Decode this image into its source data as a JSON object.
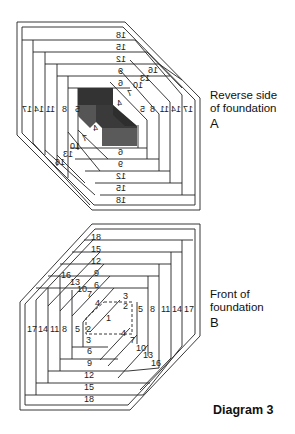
{
  "figure": {
    "title": "Diagram 3",
    "panels": [
      {
        "id": "A",
        "caption_line1": "Reverse side",
        "caption_line2": "of foundation",
        "letter": "A",
        "mirrored": true
      },
      {
        "id": "B",
        "caption_line1": "Front of",
        "caption_line2": "foundation",
        "letter": "B",
        "mirrored": false
      }
    ],
    "strip_numbers": {
      "top_stack": [
        "18",
        "15",
        "12",
        "9",
        "6",
        "3"
      ],
      "bottom_stack": [
        "18",
        "15",
        "12",
        "9",
        "6",
        "3"
      ],
      "left_column": [
        "17",
        "14",
        "11",
        "8",
        "5"
      ],
      "right_column": [
        "5",
        "8",
        "11",
        "14",
        "17"
      ],
      "upper_diagonal": [
        "16",
        "13",
        "10",
        "7",
        "4"
      ],
      "lower_diagonal": [
        "4",
        "7",
        "10",
        "13",
        "16"
      ],
      "center": "1",
      "inner_small": [
        "2",
        "2",
        "3",
        "3"
      ]
    },
    "colors": {
      "line": "#222222",
      "fabric_dark": "#333333",
      "fabric_mid": "#4a4a4a",
      "fabric_light": "#666666",
      "dashed": "#333333"
    }
  }
}
